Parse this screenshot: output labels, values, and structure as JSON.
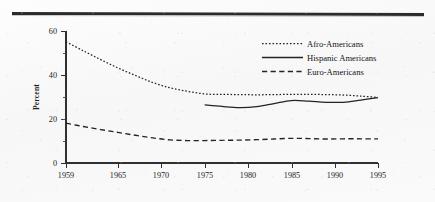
{
  "figure": {
    "background_color": "#fbfbfb",
    "ink_color": "#232323",
    "rule_color": "#2b2b2b"
  },
  "chart_data": {
    "type": "line",
    "title": "",
    "xlabel": "",
    "ylabel": "Percent",
    "xlim": [
      1959,
      1995
    ],
    "ylim": [
      0,
      60
    ],
    "grid": false,
    "legend_position": "upper-right",
    "x_ticks": [
      1959,
      1965,
      1970,
      1975,
      1980,
      1985,
      1990,
      1995
    ],
    "x_tick_labels": [
      "1959",
      "1965",
      "1970",
      "1975",
      "1980",
      "1985",
      "1990",
      "1995"
    ],
    "y_ticks": [
      0,
      20,
      40,
      60
    ],
    "y_tick_labels": [
      "0",
      "20",
      "40",
      "60"
    ],
    "y_minor_ticks": [
      10,
      30,
      50
    ],
    "series": [
      {
        "name": "Afro-Americans",
        "style": "dotted",
        "x": [
          1959,
          1961,
          1963,
          1965,
          1967,
          1969,
          1971,
          1973,
          1975,
          1977,
          1979,
          1981,
          1983,
          1985,
          1987,
          1989,
          1991,
          1993,
          1995
        ],
        "values": [
          55.1,
          51.0,
          47.0,
          43.2,
          39.8,
          36.6,
          34.2,
          32.6,
          31.4,
          31.2,
          31.1,
          31.0,
          31.1,
          31.2,
          31.2,
          31.1,
          30.9,
          30.4,
          29.8
        ]
      },
      {
        "name": "Hispanic Americans",
        "style": "solid",
        "x": [
          1975,
          1977,
          1979,
          1981,
          1983,
          1985,
          1987,
          1989,
          1991,
          1993,
          1995
        ],
        "values": [
          26.4,
          25.7,
          25.2,
          25.6,
          27.0,
          28.4,
          28.1,
          27.6,
          27.6,
          28.6,
          29.7
        ]
      },
      {
        "name": "Euro-Americans",
        "style": "dashed",
        "x": [
          1959,
          1961,
          1963,
          1965,
          1967,
          1969,
          1971,
          1973,
          1975,
          1977,
          1979,
          1981,
          1983,
          1985,
          1987,
          1989,
          1991,
          1993,
          1995
        ],
        "values": [
          18.1,
          16.6,
          15.2,
          13.9,
          12.6,
          11.4,
          10.5,
          10.2,
          10.2,
          10.3,
          10.4,
          10.6,
          10.9,
          11.2,
          11.1,
          10.9,
          11.0,
          11.0,
          11.0
        ]
      }
    ],
    "legend": [
      {
        "label": "Afro-Americans",
        "style": "dotted"
      },
      {
        "label": "Hispanic Americans",
        "style": "solid"
      },
      {
        "label": "Euro-Americans",
        "style": "dashed"
      }
    ]
  }
}
